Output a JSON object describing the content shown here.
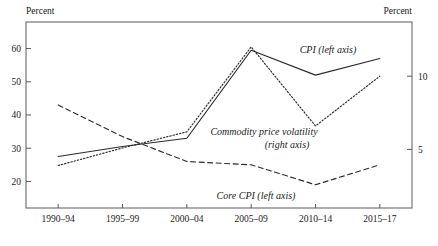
{
  "chart_data": {
    "type": "line",
    "title": "",
    "xlabel": "",
    "ylabel": "Percent",
    "ylabel_right": "Percent",
    "categories": [
      "1990–94",
      "1995–99",
      "2000–04",
      "2005–09",
      "2010–14",
      "2015–17"
    ],
    "left_axis": {
      "label": "Percent",
      "ticks": [
        20,
        30,
        40,
        50,
        60
      ],
      "tick_labels": [
        "20",
        "30",
        "40",
        "50",
        "60"
      ],
      "ylim": [
        12,
        68
      ]
    },
    "right_axis": {
      "label": "Percent",
      "ticks": [
        5,
        10
      ],
      "tick_labels": [
        "5",
        "10"
      ],
      "ylim": [
        1.0,
        13.7
      ]
    },
    "grid": false,
    "legend_position": "inline-annotations",
    "series": [
      {
        "name": "CPI (left axis)",
        "axis": "left",
        "style": "solid",
        "values": [
          27.5,
          30.5,
          33.0,
          59.5,
          52.0,
          57.0
        ]
      },
      {
        "name": "Commodity price volatility (right axis)",
        "axis": "right",
        "style": "dotted",
        "values": [
          3.9,
          5.1,
          6.2,
          12.0,
          6.6,
          10.0
        ]
      },
      {
        "name": "Core CPI (left axis)",
        "axis": "left",
        "style": "dashed",
        "values": [
          43.0,
          33.5,
          26.0,
          25.0,
          19.0,
          25.0
        ]
      }
    ],
    "annotations": [
      {
        "text": "CPI (left axis)",
        "x": 328,
        "y": 53
      },
      {
        "text": "Commodity price volatility",
        "x": 264,
        "y": 135
      },
      {
        "text": "(right axis)",
        "x": 287,
        "y": 148
      },
      {
        "text": "Core CPI (left axis)",
        "x": 256,
        "y": 199
      }
    ],
    "colors": {
      "line": "#2b2b2b",
      "axis": "#5a5a5a",
      "text": "#1a1a1a",
      "background": "#ffffff"
    }
  },
  "geometry": {
    "plot_left": 26,
    "plot_right": 412,
    "plot_top": 22,
    "plot_bottom": 208
  }
}
